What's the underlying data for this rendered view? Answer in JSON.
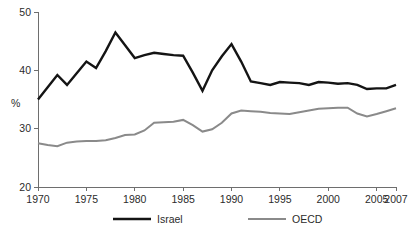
{
  "chart_data": {
    "type": "line",
    "title": "",
    "xlabel": "",
    "ylabel": "%",
    "xlim": [
      1970,
      2007
    ],
    "ylim": [
      20,
      50
    ],
    "grid": false,
    "legend_position": "bottom",
    "x": [
      1970,
      1971,
      1972,
      1973,
      1974,
      1975,
      1976,
      1977,
      1978,
      1979,
      1980,
      1981,
      1982,
      1983,
      1984,
      1985,
      1986,
      1987,
      1988,
      1989,
      1990,
      1991,
      1992,
      1993,
      1994,
      1995,
      1996,
      1997,
      1998,
      1999,
      2000,
      2001,
      2002,
      2003,
      2004,
      2005,
      2006,
      2007
    ],
    "xticks": [
      1970,
      1975,
      1980,
      1985,
      1990,
      1995,
      2000,
      2005,
      2007
    ],
    "xtick_labels": [
      "1970",
      "1975",
      "1980",
      "1985",
      "1990",
      "1995",
      "2000",
      "2005",
      "2007"
    ],
    "yticks": [
      20,
      30,
      40,
      50
    ],
    "ytick_labels": [
      "20",
      "30",
      "40",
      "50"
    ],
    "series": [
      {
        "name": "Israel",
        "color": "#141414",
        "line_width": 2.4,
        "values": [
          35.0,
          37.1,
          39.2,
          37.5,
          39.5,
          41.5,
          40.4,
          43.3,
          46.5,
          44.3,
          42.1,
          42.6,
          43.0,
          42.8,
          42.6,
          42.5,
          39.6,
          36.5,
          40.0,
          42.4,
          44.5,
          41.5,
          38.1,
          37.8,
          37.5,
          38.0,
          37.9,
          37.8,
          37.5,
          38.0,
          37.9,
          37.7,
          37.8,
          37.5,
          36.8,
          36.9,
          36.9,
          37.5
        ]
      },
      {
        "name": "OECD",
        "color": "#8a8a8a",
        "line_width": 2.0,
        "values": [
          27.5,
          27.2,
          27.0,
          27.6,
          27.8,
          27.9,
          27.9,
          28.0,
          28.4,
          28.9,
          29.0,
          29.7,
          31.0,
          31.1,
          31.2,
          31.5,
          30.6,
          29.5,
          29.9,
          31.0,
          32.6,
          33.1,
          33.0,
          32.9,
          32.7,
          32.6,
          32.5,
          32.8,
          33.1,
          33.4,
          33.5,
          33.6,
          33.6,
          32.6,
          32.1,
          32.5,
          33.0,
          33.5
        ]
      }
    ]
  },
  "legend": {
    "items": [
      {
        "label": "Israel",
        "color": "#141414"
      },
      {
        "label": "OECD",
        "color": "#8a8a8a"
      }
    ]
  },
  "axes": {
    "y_axis_title": "%"
  }
}
